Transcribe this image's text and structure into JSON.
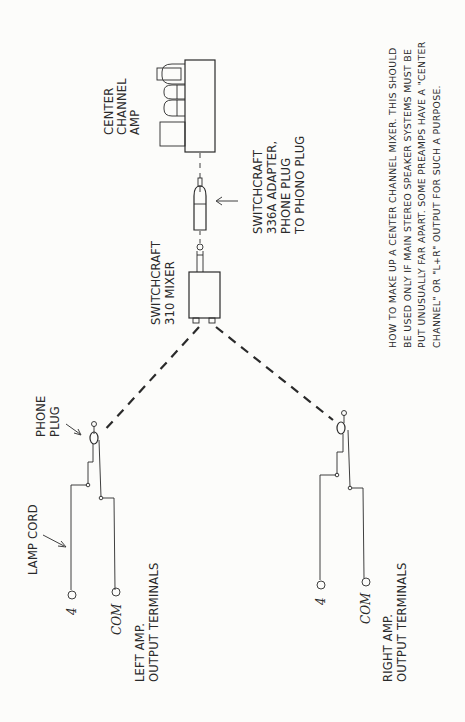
{
  "diagram": {
    "orientation": "rotated-90-ccw",
    "components": {
      "center_amp": {
        "label_lines": [
          "CENTER",
          "CHANNEL",
          "AMP"
        ]
      },
      "adapter": {
        "label_lines": [
          "SWITCHCRAFT",
          "336A ADAPTER,",
          "PHONE PLUG",
          "TO PHONO PLUG"
        ]
      },
      "mixer": {
        "label_lines": [
          "SWITCHCRAFT",
          "310 MIXER"
        ]
      },
      "left": {
        "phone_plug_label_lines": [
          "PHONE",
          "PLUG"
        ],
        "lamp_cord_label": "LAMP CORD",
        "terminal_4": "4",
        "terminal_com": "COM",
        "label_lines": [
          "LEFT AMP.",
          "OUTPUT TERMINALS"
        ]
      },
      "right": {
        "terminal_4": "4",
        "terminal_com": "COM",
        "label_lines": [
          "RIGHT AMP.",
          "OUTPUT TERMINALS"
        ]
      }
    },
    "caption_lines": [
      "HOW TO MAKE UP A CENTER CHANNEL MIXER. THIS SHOULD",
      "BE USED ONLY IF MAIN STEREO SPEAKER SYSTEMS MUST BE",
      "PUT UNUSUALLY FAR APART. SOME PREAMPS HAVE A \"CENTER",
      "CHANNEL\" OR \"L+R\" OUTPUT FOR SUCH A PURPOSE."
    ],
    "colors": {
      "ink": "#2a2a2a",
      "paper": "#fcfcfa"
    }
  }
}
